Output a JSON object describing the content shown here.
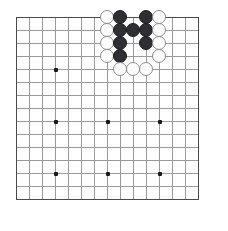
{
  "board": {
    "title": "Go board diagram",
    "size_lines": 15,
    "origin_x": 16,
    "origin_y": 17,
    "spacing": 13,
    "grid_color": "#9a9a9a",
    "edge_color": "#4a4a4a",
    "background_color": "#ffffff",
    "black_color": "#2e2e33",
    "white_color": "#fdfdfd",
    "white_outline_color": "#8c8c8c",
    "stone_diameter": 14,
    "hoshi_points": [
      {
        "col": 3,
        "row": 4
      },
      {
        "col": 3,
        "row": 8
      },
      {
        "col": 3,
        "row": 12
      },
      {
        "col": 7,
        "row": 8
      },
      {
        "col": 7,
        "row": 12
      },
      {
        "col": 11,
        "row": 8
      },
      {
        "col": 11,
        "row": 12
      }
    ],
    "stones": [
      {
        "col": 7,
        "row": 0,
        "color": "white"
      },
      {
        "col": 8,
        "row": 0,
        "color": "black"
      },
      {
        "col": 10,
        "row": 0,
        "color": "black"
      },
      {
        "col": 11,
        "row": 0,
        "color": "white"
      },
      {
        "col": 7,
        "row": 1,
        "color": "white"
      },
      {
        "col": 8,
        "row": 1,
        "color": "black"
      },
      {
        "col": 9,
        "row": 1,
        "color": "black"
      },
      {
        "col": 10,
        "row": 1,
        "color": "black"
      },
      {
        "col": 11,
        "row": 1,
        "color": "white"
      },
      {
        "col": 7,
        "row": 2,
        "color": "white"
      },
      {
        "col": 8,
        "row": 2,
        "color": "black"
      },
      {
        "col": 10,
        "row": 2,
        "color": "black"
      },
      {
        "col": 11,
        "row": 2,
        "color": "white"
      },
      {
        "col": 7,
        "row": 3,
        "color": "white"
      },
      {
        "col": 8,
        "row": 3,
        "color": "black"
      },
      {
        "col": 11,
        "row": 3,
        "color": "white"
      },
      {
        "col": 8,
        "row": 4,
        "color": "white"
      },
      {
        "col": 9,
        "row": 4,
        "color": "white"
      },
      {
        "col": 10,
        "row": 4,
        "color": "white"
      }
    ]
  }
}
